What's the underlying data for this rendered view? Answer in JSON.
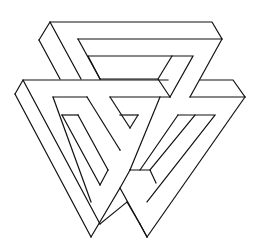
{
  "figure": {
    "title": "Impossible triangle figure (line drawing)",
    "stroke_color": "#111111",
    "background": "#ffffff",
    "width": 260,
    "height": 252
  }
}
